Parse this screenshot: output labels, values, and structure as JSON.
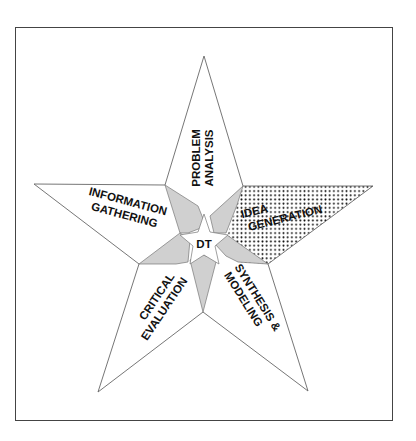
{
  "diagram": {
    "center_label": "DT",
    "arms": [
      {
        "id": "top",
        "lines": [
          "PROBLEM",
          "ANALYSIS"
        ],
        "highlighted": false
      },
      {
        "id": "right",
        "lines": [
          "IDEA",
          "GENERATION"
        ],
        "highlighted": true
      },
      {
        "id": "bottom-right",
        "lines": [
          "SYNTHESIS &",
          "MODELING"
        ],
        "highlighted": false
      },
      {
        "id": "bottom-left",
        "lines": [
          "CRITICAL",
          "EVALUATION"
        ],
        "highlighted": false
      },
      {
        "id": "left",
        "lines": [
          "INFORMATION",
          "GATHERING"
        ],
        "highlighted": false
      }
    ],
    "colors": {
      "outline": "#555555",
      "kite_fill": "#d0d0d0",
      "frame": "#444444",
      "dots": "#111111"
    }
  }
}
